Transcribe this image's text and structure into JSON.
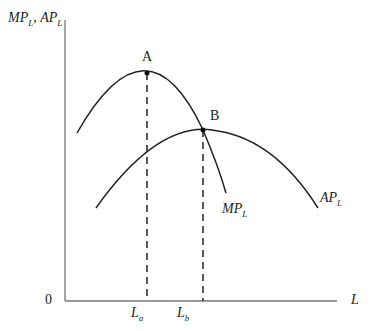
{
  "diagram": {
    "y_axis_label": {
      "p1": "MP",
      "s1": "L",
      "sep": ", ",
      "p2": "AP",
      "s2": "L"
    },
    "x_axis_label": "L",
    "origin_label": "0",
    "point_a_label": "A",
    "point_b_label": "B",
    "mp_curve_label": {
      "main": "MP",
      "sub": "L"
    },
    "ap_curve_label": {
      "main": "AP",
      "sub": "L"
    },
    "la_label": {
      "main": "L",
      "sub": "a"
    },
    "lb_label": {
      "main": "L",
      "sub": "b"
    },
    "colors": {
      "line": "#222222",
      "axis": "#777777"
    }
  }
}
